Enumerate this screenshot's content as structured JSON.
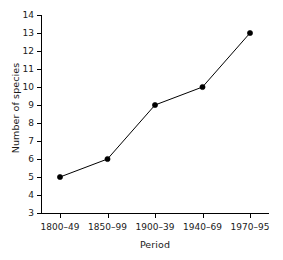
{
  "chart_data": {
    "type": "line",
    "title": "",
    "xlabel": "Period",
    "ylabel": "Number of species",
    "categories": [
      "1800–49",
      "1850–99",
      "1900–39",
      "1940–69",
      "1970–95"
    ],
    "values": [
      5,
      6,
      9,
      10,
      13
    ],
    "series": [
      {
        "name": "Number of species",
        "values": [
          5,
          6,
          9,
          10,
          13
        ]
      }
    ],
    "ylim": [
      3,
      14
    ],
    "yticks": [
      3,
      4,
      5,
      6,
      7,
      8,
      9,
      10,
      11,
      12,
      13,
      14
    ],
    "ytick_labels": [
      "3",
      "4",
      "5",
      "6",
      "7",
      "8",
      "9",
      "10",
      "11",
      "12",
      "13",
      "14"
    ],
    "grid": false,
    "legend": false,
    "legend_position": "none",
    "marker": "filled-circle",
    "line_color": "#000000",
    "marker_color": "#000000",
    "background_color": "#ffffff"
  }
}
